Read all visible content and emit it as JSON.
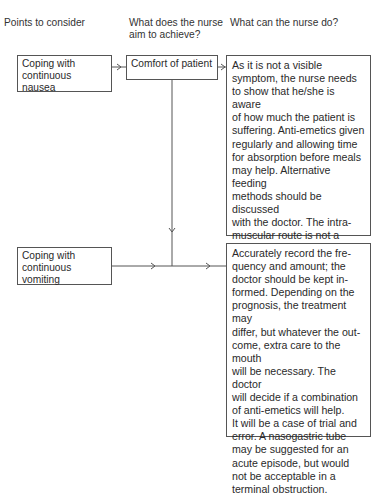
{
  "headers": {
    "col1": "Points to consider",
    "col2_line1": "What does the nurse",
    "col2_line2": "aim to achieve?",
    "col3": "What can the nurse do?"
  },
  "points": [
    {
      "lines": [
        "Coping with",
        "continuous",
        "nausea"
      ]
    },
    {
      "lines": [
        "Coping with",
        "continuous",
        "vomiting"
      ]
    }
  ],
  "aim": {
    "label": "Comfort of patient"
  },
  "actions": [
    {
      "lines": [
        "As it is not a visible",
        "symptom, the nurse needs",
        "to show that he/she is aware",
        "of how much the patient is",
        "suffering. Anti-emetics given",
        "regularly and allowing time",
        "for absorption before meals",
        "may help. Alternative feeding",
        "methods should be discussed",
        "with the doctor. The intra-",
        "muscular route is not a long-",
        "term solution; perhaps the",
        "rectal route, if acceptable to",
        "the patient, is more satis-",
        "factory."
      ]
    },
    {
      "lines": [
        "Accurately record the fre-",
        "quency and amount; the",
        "doctor should be kept in-",
        "formed. Depending on the",
        "prognosis, the treatment may",
        "differ, but whatever the out-",
        "come, extra care to the mouth",
        "will be necessary. The doctor",
        "will decide if a combination",
        "of anti-emetics will help.",
        "It will be a case of trial and",
        "error. A nasogastric tube",
        "may be suggested for an",
        "acute episode, but would",
        "not be acceptable in a",
        "terminal obstruction."
      ]
    }
  ]
}
